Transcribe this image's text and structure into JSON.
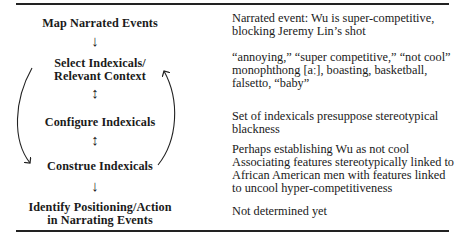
{
  "diagram": {
    "steps": [
      {
        "label": "Map Narrated Events"
      },
      {
        "label_line1": "Select Indexicals/",
        "label_line2": "Relevant Context"
      },
      {
        "label": "Configure Indexicals"
      },
      {
        "label": "Construe Indexicals"
      },
      {
        "label_line1": "Identify Positioning/Action",
        "label_line2": "in Narrating Events"
      }
    ],
    "connectors": [
      {
        "from": 0,
        "to": 1,
        "type": "down-arrow",
        "glyph": "↓"
      },
      {
        "from": 1,
        "to": 2,
        "type": "bidirectional-arrow",
        "glyph": "↕"
      },
      {
        "from": 2,
        "to": 3,
        "type": "bidirectional-arrow",
        "glyph": "↕"
      },
      {
        "from": 3,
        "to": 4,
        "type": "down-arrow",
        "glyph": "↓"
      }
    ],
    "loop_arrows": [
      {
        "side": "left",
        "from": "Select Indexicals/Relevant Context",
        "to": "Construe Indexicals"
      },
      {
        "side": "right",
        "from": "Construe Indexicals",
        "to": "Select Indexicals/Relevant Context"
      }
    ]
  },
  "descriptions": [
    {
      "lines": [
        "Narrated event: Wu is super-competitive,",
        "blocking Jeremy Lin’s shot"
      ]
    },
    {
      "lines": [
        "“annoying,” “super competitive,” “not cool”",
        "monophthong [aː], boasting, basketball,",
        "falsetto, “baby”"
      ]
    },
    {
      "lines": [
        "Set of indexicals presuppose stereotypical",
        "blackness"
      ]
    },
    {
      "lines": [
        "Perhaps establishing Wu as not cool",
        "Associating features stereotypically linked to",
        "African American men with features linked",
        "to uncool hyper-competitiveness"
      ]
    },
    {
      "lines": [
        "Not determined yet"
      ]
    }
  ]
}
